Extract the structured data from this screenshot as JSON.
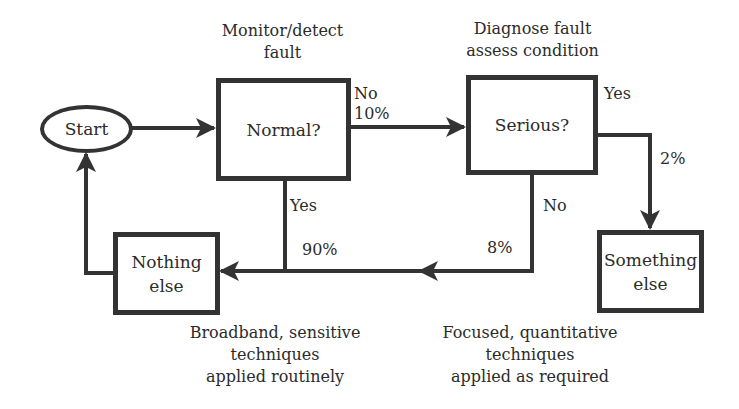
{
  "diagram": {
    "type": "flowchart",
    "nodes": {
      "start": {
        "label": "Start"
      },
      "normal": {
        "label": "Normal?",
        "caption_line1": "Monitor/detect",
        "caption_line2": "fault"
      },
      "serious": {
        "label": "Serious?",
        "caption_line1": "Diagnose fault",
        "caption_line2": "assess condition"
      },
      "nothing_else": {
        "label_line1": "Nothing",
        "label_line2": "else"
      },
      "something_else": {
        "label_line1": "Something",
        "label_line2": "else"
      }
    },
    "edges": {
      "normal_no": {
        "label": "No",
        "percent": "10%"
      },
      "normal_yes": {
        "label": "Yes",
        "percent": "90%"
      },
      "serious_yes": {
        "label": "Yes",
        "percent": "2%"
      },
      "serious_no": {
        "label": "No",
        "percent": "8%"
      }
    },
    "notes": {
      "left": {
        "line1": "Broadband, sensitive",
        "line2": "techniques",
        "line3": "applied routinely"
      },
      "right": {
        "line1": "Focused, quantitative",
        "line2": "techniques",
        "line3": "applied as required"
      }
    },
    "colors": {
      "stroke": "#333333",
      "text": "#2b2b2b",
      "background": "#ffffff"
    }
  }
}
